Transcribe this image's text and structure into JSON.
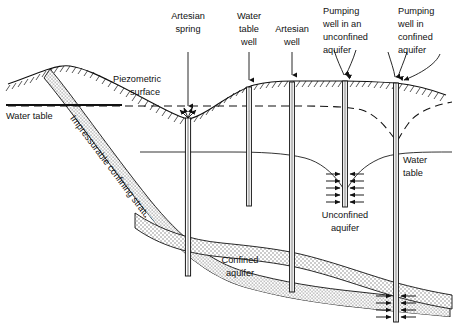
{
  "figure": {
    "type": "hydrogeology-cross-section",
    "title": "",
    "background_color": "#ffffff",
    "line_color": "#111111",
    "aquifer_fill": "#d8d8d8",
    "confining_fill": "#cfcfcf",
    "width": 455,
    "height": 326
  },
  "labels": {
    "artesian_spring": [
      "Artesian",
      "spring"
    ],
    "water_table_well": [
      "Water",
      "table",
      "well"
    ],
    "artesian_well": [
      "Artesian",
      "well"
    ],
    "pumping_well_unconfined": [
      "Pumping",
      "well in an",
      "unconfined",
      "aquifer"
    ],
    "pumping_well_confined": [
      "Pumping",
      "well in",
      "confined",
      "aquifer"
    ],
    "piezometric_surface": [
      "Piezometric",
      "surface"
    ],
    "water_table_left": "Water table",
    "water_table_right": [
      "Water",
      "table"
    ],
    "confining_stratum": "Impressurable confining stratum",
    "confined_aquifer": [
      "Confined",
      "aquifer"
    ],
    "unconfined_aquifer": [
      "Unconfined",
      "aquifer"
    ]
  },
  "features": {
    "wells": [
      {
        "name": "artesian-spring",
        "x": 188,
        "top": 110,
        "bottom": 275,
        "kind": "spring"
      },
      {
        "name": "water-table-well",
        "x": 249,
        "top": 88,
        "bottom": 205,
        "kind": "observation"
      },
      {
        "name": "artesian-well",
        "x": 292,
        "top": 83,
        "bottom": 290,
        "kind": "artesian"
      },
      {
        "name": "pumping-well-unconfined",
        "x": 345,
        "top": 82,
        "bottom": 205,
        "kind": "pumping"
      },
      {
        "name": "pumping-well-confined",
        "x": 396,
        "top": 84,
        "bottom": 322,
        "kind": "pumping"
      }
    ],
    "surfaces": {
      "piezometric_surface_style": "dashed",
      "water_table_style": "solid-thin",
      "ground_surface_style": "hatched"
    },
    "flow_arrows": {
      "unconfined_rows": 5,
      "confined_rows": 4,
      "direction": "inward"
    }
  }
}
